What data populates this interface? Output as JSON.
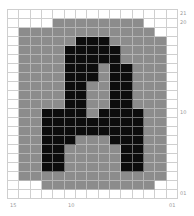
{
  "figure": {
    "glyph": "A",
    "columns": 15,
    "rows": 21,
    "colors": {
      "empty": "#ffffff",
      "padding": "#8c8c8c",
      "ink": "#0c0c0c",
      "gridline": "#cfcfcf"
    },
    "legend_codes": {
      "0": "empty",
      "1": "padding",
      "2": "ink"
    },
    "cells": [
      "000000000000000",
      "000011111111000",
      "011111111111100",
      "011111222111110",
      "011112222211110",
      "011112222211110",
      "011112221221110",
      "011112221221110",
      "011112211221110",
      "011112211221110",
      "011112211221110",
      "011222212222110",
      "011222222222110",
      "011222222222110",
      "011222111222110",
      "011221111122110",
      "011221111122110",
      "011221111122110",
      "011111111111110",
      "000111111111100",
      "000000000000000"
    ],
    "right_labels": [
      {
        "text": "21",
        "row": 0
      },
      {
        "text": "20",
        "row": 1
      },
      {
        "text": "10",
        "row": 11
      },
      {
        "text": "01",
        "row": 20
      }
    ],
    "bottom_labels": [
      {
        "text": "15",
        "col": 0
      },
      {
        "text": "10",
        "col": 5
      },
      {
        "text": "01",
        "col": 14
      }
    ]
  }
}
